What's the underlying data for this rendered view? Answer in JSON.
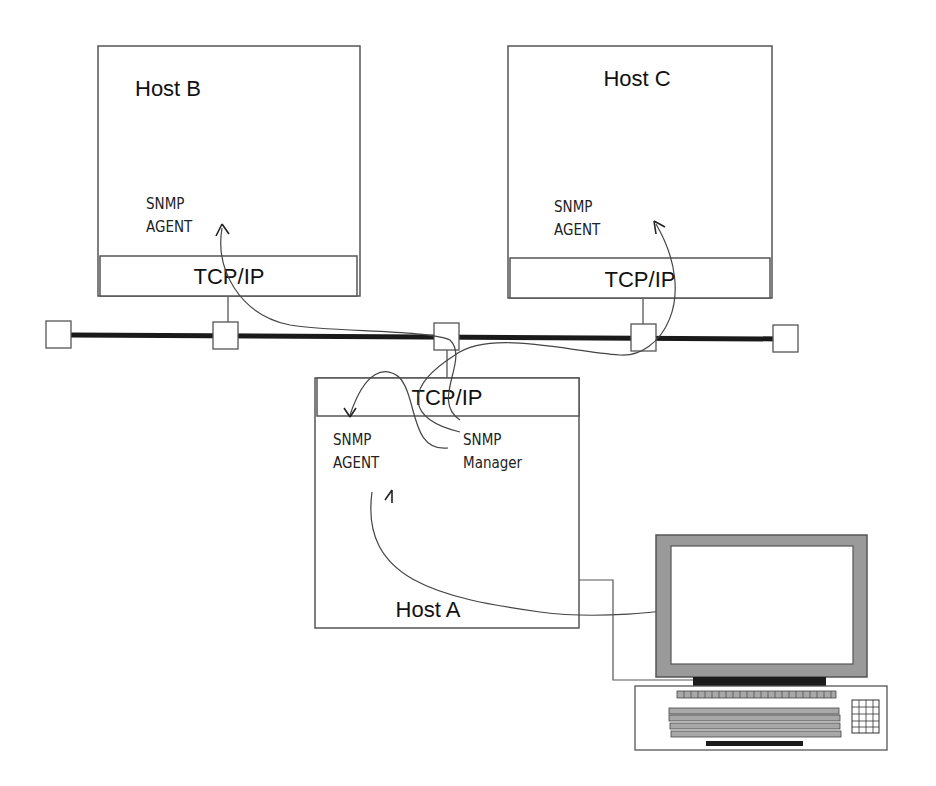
{
  "diagram": {
    "hosts": [
      {
        "id": "host-b",
        "title": "Host B",
        "stack": "TCP/IP",
        "services": [
          {
            "line1": "SNMP",
            "line2": "AGENT"
          }
        ]
      },
      {
        "id": "host-c",
        "title": "Host C",
        "stack": "TCP/IP",
        "services": [
          {
            "line1": "SNMP",
            "line2": "AGENT"
          }
        ]
      },
      {
        "id": "host-a",
        "title": "Host A",
        "stack": "TCP/IP",
        "services": [
          {
            "line1": "SNMP",
            "line2": "AGENT"
          },
          {
            "line1": "SNMP",
            "line2": "Manager"
          }
        ]
      }
    ],
    "network": {
      "type": "bus",
      "nodes": 5
    },
    "terminal": {
      "type": "workstation",
      "parts": [
        "monitor",
        "keyboard"
      ]
    },
    "flows": [
      {
        "from": "SNMP Manager (Host A)",
        "to": "SNMP AGENT (Host B)"
      },
      {
        "from": "SNMP Manager (Host A)",
        "to": "SNMP AGENT (Host C)"
      },
      {
        "from": "SNMP Manager (Host A)",
        "to": "SNMP AGENT (Host A)"
      },
      {
        "from": "Workstation",
        "to": "SNMP AGENT (Host A)"
      }
    ]
  }
}
